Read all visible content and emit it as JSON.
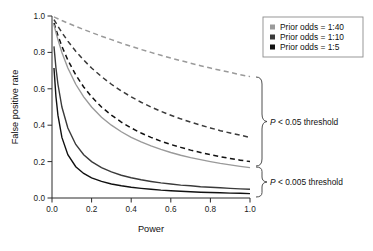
{
  "figure": {
    "background": "#ffffff",
    "plot_area": {
      "left": 52,
      "right": 250,
      "top": 16,
      "bottom": 198
    }
  },
  "chart_data": {
    "type": "line",
    "title": "",
    "xlabel": "Power",
    "ylabel": "False positive rate",
    "xlim": [
      0,
      1
    ],
    "ylim": [
      0,
      1
    ],
    "xticks": [
      0.0,
      0.2,
      0.4,
      0.6,
      0.8,
      1.0
    ],
    "yticks": [
      0.0,
      0.2,
      0.4,
      0.6,
      0.8,
      1.0
    ],
    "xtick_labels": [
      "0.0",
      "0.2",
      "0.4",
      "0.6",
      "0.8",
      "1.0"
    ],
    "ytick_labels": [
      "0.0",
      "0.2",
      "0.4",
      "0.6",
      "0.8",
      "1.0"
    ],
    "grid": false,
    "legend_position": "top-right",
    "x": [
      0.01,
      0.02,
      0.03,
      0.05,
      0.08,
      0.12,
      0.16,
      0.2,
      0.25,
      0.3,
      0.35,
      0.4,
      0.45,
      0.5,
      0.55,
      0.6,
      0.65,
      0.7,
      0.75,
      0.8,
      0.85,
      0.9,
      0.95,
      1.0
    ],
    "series": [
      {
        "name": "Prior odds = 1:40, P < 0.05 threshold",
        "prior_odds": "1:40",
        "threshold": "P < 0.05",
        "alpha": 0.05,
        "odds": 0.025,
        "style": "dashed",
        "color": "#9a9a9a",
        "values": [
          0.995,
          0.99,
          0.985,
          0.975,
          0.961,
          0.943,
          0.926,
          0.909,
          0.889,
          0.87,
          0.851,
          0.833,
          0.816,
          0.8,
          0.784,
          0.769,
          0.755,
          0.741,
          0.727,
          0.714,
          0.702,
          0.69,
          0.678,
          0.667
        ]
      },
      {
        "name": "Prior odds = 1:10, P < 0.05 threshold",
        "prior_odds": "1:10",
        "threshold": "P < 0.05",
        "alpha": 0.05,
        "odds": 0.1,
        "style": "dashed",
        "color": "#3a3a3a",
        "values": [
          0.98,
          0.962,
          0.943,
          0.909,
          0.862,
          0.806,
          0.758,
          0.714,
          0.667,
          0.625,
          0.588,
          0.556,
          0.526,
          0.5,
          0.476,
          0.455,
          0.435,
          0.417,
          0.4,
          0.385,
          0.37,
          0.357,
          0.345,
          0.333
        ]
      },
      {
        "name": "Prior odds = 1:5, P < 0.05 threshold",
        "prior_odds": "1:5",
        "threshold": "P < 0.05",
        "alpha": 0.05,
        "odds": 0.2,
        "style": "dashed",
        "color": "#111111",
        "values": [
          0.962,
          0.926,
          0.893,
          0.833,
          0.758,
          0.676,
          0.61,
          0.556,
          0.5,
          0.455,
          0.417,
          0.385,
          0.357,
          0.333,
          0.312,
          0.294,
          0.278,
          0.263,
          0.25,
          0.238,
          0.227,
          0.217,
          0.208,
          0.2
        ]
      },
      {
        "name": "Prior odds = 1:40, P < 0.005 threshold",
        "prior_odds": "1:40",
        "threshold": "P < 0.005",
        "alpha": 0.005,
        "odds": 0.025,
        "style": "solid",
        "color": "#9a9a9a",
        "values": [
          0.952,
          0.909,
          0.87,
          0.8,
          0.714,
          0.625,
          0.556,
          0.5,
          0.444,
          0.4,
          0.364,
          0.333,
          0.308,
          0.286,
          0.267,
          0.25,
          0.235,
          0.222,
          0.211,
          0.2,
          0.19,
          0.182,
          0.174,
          0.167
        ]
      },
      {
        "name": "Prior odds = 1:10, P < 0.005 threshold",
        "prior_odds": "1:10",
        "threshold": "P < 0.005",
        "alpha": 0.005,
        "odds": 0.1,
        "style": "solid",
        "color": "#3a3a3a",
        "values": [
          0.833,
          0.714,
          0.625,
          0.5,
          0.385,
          0.294,
          0.238,
          0.2,
          0.167,
          0.143,
          0.125,
          0.111,
          0.1,
          0.091,
          0.083,
          0.077,
          0.071,
          0.067,
          0.062,
          0.059,
          0.056,
          0.053,
          0.05,
          0.048
        ]
      },
      {
        "name": "Prior odds = 1:5, P < 0.005 threshold",
        "prior_odds": "1:5",
        "threshold": "P < 0.005",
        "alpha": 0.005,
        "odds": 0.2,
        "style": "solid",
        "color": "#111111",
        "values": [
          0.714,
          0.556,
          0.455,
          0.333,
          0.238,
          0.172,
          0.135,
          0.111,
          0.091,
          0.077,
          0.067,
          0.059,
          0.053,
          0.048,
          0.043,
          0.04,
          0.037,
          0.034,
          0.032,
          0.03,
          0.029,
          0.027,
          0.026,
          0.024
        ]
      }
    ],
    "annotations": [
      {
        "text_prefix": "P",
        "text_rest": " < 0.05 threshold",
        "group": "dashed"
      },
      {
        "text_prefix": "P",
        "text_rest": " < 0.005 threshold",
        "group": "solid"
      }
    ]
  },
  "axes": {
    "xlabel": "Power",
    "ylabel": "False positive rate",
    "xtick_labels": [
      "0.0",
      "0.2",
      "0.4",
      "0.6",
      "0.8",
      "1.0"
    ],
    "ytick_labels": [
      "0.0",
      "0.2",
      "0.4",
      "0.6",
      "0.8",
      "1.0"
    ],
    "axis_color": "#2b2b2b"
  },
  "legend": {
    "border_color": "#8c8c8c",
    "background": "#ffffff",
    "items": [
      {
        "label": "Prior odds = 1:40",
        "swatch_color": "#9a9a9a"
      },
      {
        "label": "Prior odds = 1:10",
        "swatch_color": "#3a3a3a"
      },
      {
        "label": "Prior odds = 1:5",
        "swatch_color": "#111111"
      }
    ]
  },
  "annotations": {
    "upper": {
      "italic": "P",
      "rest": " < 0.05 threshold"
    },
    "lower": {
      "italic": "P",
      "rest": " < 0.005 threshold"
    }
  }
}
